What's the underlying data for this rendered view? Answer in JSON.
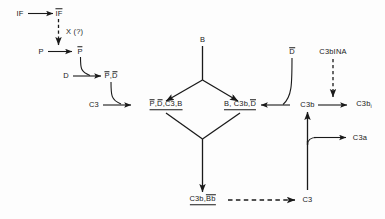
{
  "diagram": {
    "background_color": "#fdfdfd",
    "stroke_color": "#1a1a1a",
    "nodes": {
      "if": "IF",
      "if_activated_pre": "I",
      "if_activated_post": "F",
      "x_unknown": "X (?)",
      "p": "P",
      "p_bar": "P",
      "d": "D",
      "pd_bar_p": "P",
      "pd_bar_sep": ",",
      "pd_bar_d": "D",
      "c3_left": "C3",
      "complex_left_p": "P",
      "complex_left_s1": ",",
      "complex_left_d": "D",
      "complex_left_s2": ",C3,B",
      "b_top": "B",
      "complex_right_pre": "B, C3b,",
      "complex_right_d": "D",
      "d_bar_right": "D",
      "c3b": "C3b",
      "c3bina": "C3bINA",
      "c3bi_base": "C3b",
      "c3bi_sub": "i",
      "c3a": "C3a",
      "c3b_bb_pre": "C3b,",
      "c3b_bb_post": "Bb",
      "c3_bottom": "C3"
    }
  }
}
